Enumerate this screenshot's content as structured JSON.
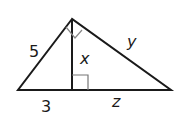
{
  "diagram": {
    "type": "right-triangle-with-altitude",
    "labels": {
      "left_leg": "5",
      "hypotenuse_right_side": "y",
      "altitude": "x",
      "left_base_segment": "3",
      "right_base_segment": "z"
    },
    "colors": {
      "stroke": "#1a1a1a",
      "marker": "#777777",
      "background": "#ffffff"
    }
  }
}
